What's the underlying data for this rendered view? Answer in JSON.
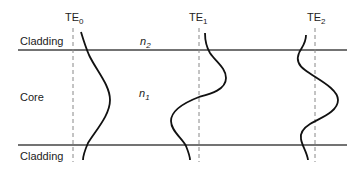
{
  "diagram": {
    "regions": {
      "top": "Cladding",
      "middle": "Core",
      "bottom": "Cladding"
    },
    "indices": {
      "cladding": "n",
      "cladding_sub": "2",
      "core": "n",
      "core_sub": "1"
    },
    "modes": [
      {
        "base": "TE",
        "sub": "0"
      },
      {
        "base": "TE",
        "sub": "1"
      },
      {
        "base": "TE",
        "sub": "2"
      }
    ],
    "colors": {
      "line": "#444444",
      "curve": "#111111",
      "dashed": "#888888"
    }
  }
}
